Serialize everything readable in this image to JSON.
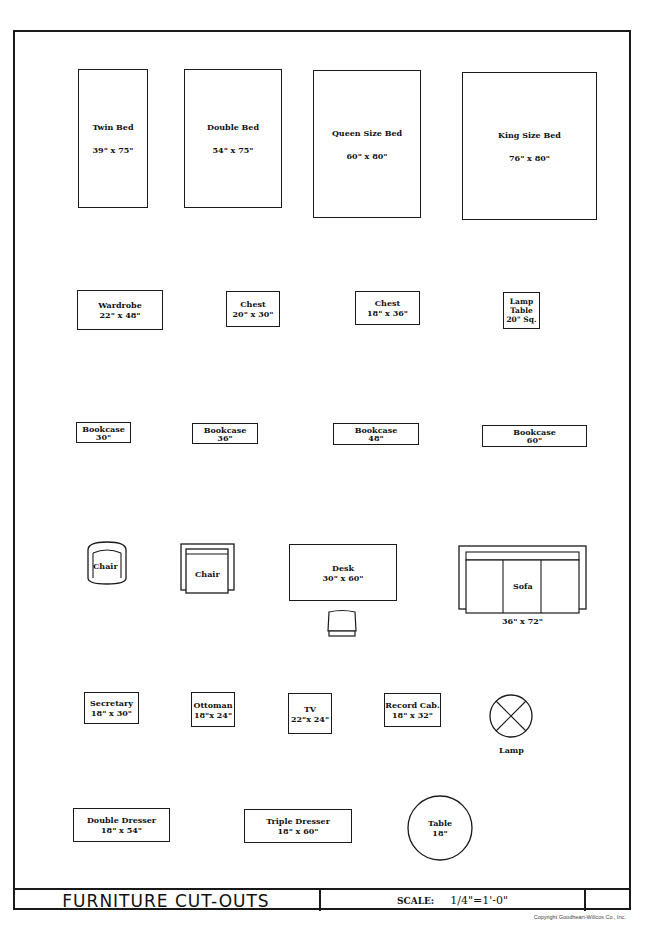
{
  "sheet": {
    "title": "FURNITURE CUT-OUTS",
    "scale_label": "SCALE:",
    "scale_value": "1/4\"=1'-0\"",
    "copyright": "Copyright Goodheart-Willcox Co., Inc."
  },
  "beds": [
    {
      "label": "Twin Bed",
      "size": "39\" x 75\""
    },
    {
      "label": "Double Bed",
      "size": "54\" x 75\""
    },
    {
      "label": "Queen Size Bed",
      "size": "60\" x 80\""
    },
    {
      "label": "King Size Bed",
      "size": "76\" x 80\""
    }
  ],
  "storage": [
    {
      "label": "Wardrobe",
      "size": "22\" x 48\""
    },
    {
      "label": "Chest",
      "size": "20\" x 30\""
    },
    {
      "label": "Chest",
      "size": "18\" x 36\""
    },
    {
      "label": "Lamp Table",
      "size": "20\" Sq."
    }
  ],
  "bookcases": [
    {
      "label": "Bookcase",
      "size": "30\""
    },
    {
      "label": "Bookcase",
      "size": "36\""
    },
    {
      "label": "Bookcase",
      "size": "48\""
    },
    {
      "label": "Bookcase",
      "size": "60\""
    }
  ],
  "seating": {
    "chair1": {
      "label": "Chair"
    },
    "chair2": {
      "label": "Chair"
    },
    "desk": {
      "label": "Desk",
      "size": "30\" x 60\""
    },
    "sofa": {
      "label": "Sofa",
      "size": "36\" x 72\""
    }
  },
  "misc": [
    {
      "label": "Secretary",
      "size": "18\" x 30\""
    },
    {
      "label": "Ottoman",
      "size": "18\"x 24\""
    },
    {
      "label": "TV",
      "size": "22\"x 24\""
    },
    {
      "label": "Record Cab.",
      "size": "18\" x 32\""
    },
    {
      "label": "Lamp"
    }
  ],
  "dressers": [
    {
      "label": "Double Dresser",
      "size": "18\" x 54\""
    },
    {
      "label": "Triple Dresser",
      "size": "18\" x 60\""
    },
    {
      "label": "Table",
      "size": "18\""
    }
  ]
}
